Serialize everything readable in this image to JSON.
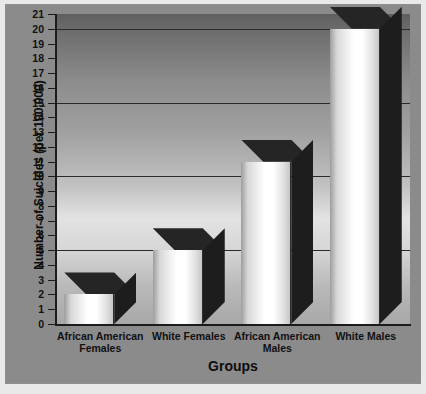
{
  "chart_data": {
    "type": "bar",
    "title": "",
    "xlabel": "Groups",
    "ylabel": "Number of Suicides (per 100,000)",
    "categories": [
      "African American Females",
      "White Females",
      "African American Males",
      "White Males"
    ],
    "values": [
      2,
      5,
      11,
      20
    ],
    "ylim": [
      0,
      21
    ],
    "ytick_step": 1,
    "yticks": [
      0,
      1,
      2,
      3,
      4,
      5,
      6,
      7,
      8,
      9,
      10,
      11,
      12,
      13,
      14,
      15,
      16,
      17,
      18,
      19,
      20,
      21
    ],
    "gridlines_at": [
      5,
      10,
      15,
      20
    ],
    "grid": true,
    "legend": false,
    "style": "3d-bars",
    "bar_face_color": "#ffffff",
    "bar_shadow_color": "#1d1d1d",
    "plot_background": "#a8a8a8",
    "figure_background": "#8b8b8b"
  },
  "categories": [
    {
      "line1": "African American",
      "line2": "Females"
    },
    {
      "line1": "White Females",
      "line2": ""
    },
    {
      "line1": "African American",
      "line2": "Males"
    },
    {
      "line1": "White Males",
      "line2": ""
    }
  ],
  "axis": {
    "x_title": "Groups",
    "y_title": "Number of Suicides (per 100,000)"
  }
}
